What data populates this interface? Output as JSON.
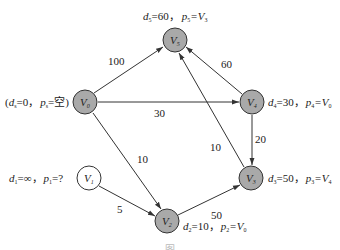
{
  "diagram": {
    "type": "directed-weighted-graph",
    "colors": {
      "visited_fill": "#a9a9a9",
      "unvisited_fill": "#ffffff",
      "stroke": "#333333",
      "edge": "#333333",
      "text": "#222222"
    },
    "nodes": [
      {
        "id": "V0",
        "name": "V",
        "sub": "0",
        "x": 85,
        "y": 102,
        "visited": true,
        "annotation": {
          "d_label": "d",
          "d_sub": "s",
          "d_val": "=0，",
          "p_label": "p",
          "p_sub": "s",
          "p_val": "=空)",
          "prefix": "("
        }
      },
      {
        "id": "V1",
        "name": "V",
        "sub": "1",
        "x": 89,
        "y": 178,
        "visited": false,
        "annotation": {
          "d_label": "d",
          "d_sub": "1",
          "d_val": "=∞，",
          "p_label": "p",
          "p_sub": "1",
          "p_val": "=?"
        }
      },
      {
        "id": "V2",
        "name": "V",
        "sub": "2",
        "x": 167,
        "y": 221,
        "visited": true,
        "annotation": {
          "d_label": "d",
          "d_sub": "2",
          "d_val": "=10，",
          "p_label": "p",
          "p_sub": "2",
          "p_val": "=V",
          "p_val_sub": "0"
        }
      },
      {
        "id": "V3",
        "name": "V",
        "sub": "3",
        "x": 251,
        "y": 178,
        "visited": true,
        "annotation": {
          "d_label": "d",
          "d_sub": "3",
          "d_val": "=50，",
          "p_label": "p",
          "p_sub": "3",
          "p_val": "=V",
          "p_val_sub": "4"
        }
      },
      {
        "id": "V4",
        "name": "V",
        "sub": "4",
        "x": 252,
        "y": 102,
        "visited": true,
        "annotation": {
          "d_label": "d",
          "d_sub": "4",
          "d_val": "=30，",
          "p_label": "p",
          "p_sub": "4",
          "p_val": "=V",
          "p_val_sub": "0"
        }
      },
      {
        "id": "V5",
        "name": "V",
        "sub": "5",
        "x": 175,
        "y": 40,
        "visited": true,
        "annotation": {
          "d_label": "d",
          "d_sub": "5",
          "d_val": "=60，",
          "p_label": "p",
          "p_sub": "5",
          "p_val": "=V",
          "p_val_sub": "3"
        }
      }
    ],
    "edges": [
      {
        "from": "V0",
        "to": "V5",
        "weight": "100"
      },
      {
        "from": "V0",
        "to": "V4",
        "weight": "30"
      },
      {
        "from": "V0",
        "to": "V2",
        "weight": "10"
      },
      {
        "from": "V4",
        "to": "V5",
        "weight": "60"
      },
      {
        "from": "V4",
        "to": "V3",
        "weight": "20"
      },
      {
        "from": "V3",
        "to": "V5",
        "weight": "10"
      },
      {
        "from": "V1",
        "to": "V2",
        "weight": "5"
      },
      {
        "from": "V2",
        "to": "V3",
        "weight": "50"
      }
    ],
    "caption": "图"
  }
}
